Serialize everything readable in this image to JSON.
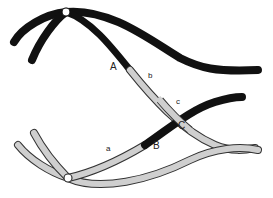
{
  "diagram": {
    "type": "chromosome-crossing-over",
    "colors": {
      "dark_chromosome": "#111111",
      "light_chromosome": "#cfcfcf",
      "light_outline": "#333333",
      "centromere": "#ffffff",
      "background": "#ffffff"
    },
    "labels": {
      "A": "A",
      "b": "b",
      "c": "c",
      "B": "B",
      "C": "C",
      "a": "a"
    }
  }
}
